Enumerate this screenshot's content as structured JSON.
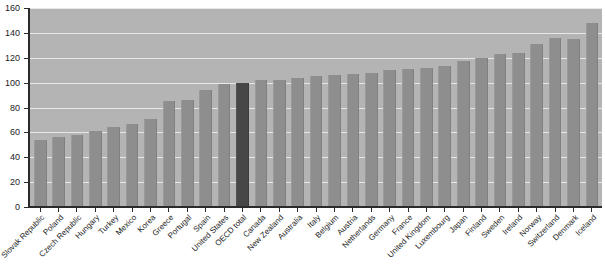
{
  "chart": {
    "title": "",
    "y_axis_label": "",
    "x_axis_label": ""
  },
  "chart_data": {
    "type": "bar",
    "title": "",
    "xlabel": "",
    "ylabel": "",
    "ylim": [
      0,
      160
    ],
    "yticks": [
      0,
      20,
      40,
      60,
      80,
      100,
      120,
      140,
      160
    ],
    "grid": true,
    "legend": false,
    "highlight_category": "OECD total",
    "colors": {
      "bar": "#8e8e8e",
      "highlight_bar": "#474747",
      "plot_background": "#b4b4b4",
      "gridline": "#f0f0f0",
      "axis": "#2b2b2b",
      "text": "#1c1c1c",
      "page_background": "#ffffff"
    },
    "categories": [
      "Slovak Republic",
      "Poland",
      "Czech Republic",
      "Hungary",
      "Turkey",
      "Mexico",
      "Korea",
      "Greece",
      "Portugal",
      "Spain",
      "United States",
      "OECD total",
      "Canada",
      "New Zealand",
      "Australia",
      "Italy",
      "Belgium",
      "Austria",
      "Netherlands",
      "Germany",
      "France",
      "United Kingdom",
      "Luxembourg",
      "Japan",
      "Finland",
      "Sweden",
      "Ireland",
      "Norway",
      "Switzerland",
      "Denmark",
      "Iceland"
    ],
    "values": [
      54,
      56,
      58,
      61,
      64,
      67,
      71,
      85,
      86,
      94,
      99,
      100,
      102,
      102,
      104,
      105,
      106,
      107,
      108,
      110,
      111,
      112,
      113,
      117,
      120,
      123,
      124,
      131,
      136,
      135,
      148
    ]
  }
}
